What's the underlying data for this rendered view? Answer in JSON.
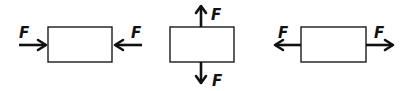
{
  "diagram": {
    "colors": {
      "stroke": "#111111",
      "background": "#ffffff"
    },
    "panels": [
      {
        "id": "compression",
        "box": {
          "x": 48,
          "y": 27,
          "w": 64,
          "h": 35
        },
        "forces": [
          {
            "label": "F",
            "direction": "right",
            "note": "pushes into left side"
          },
          {
            "label": "F",
            "direction": "left",
            "note": "pushes into right side"
          }
        ]
      },
      {
        "id": "vertical",
        "box": {
          "x": 170,
          "y": 27,
          "w": 64,
          "h": 35
        },
        "forces": [
          {
            "label": "F",
            "direction": "up",
            "note": "pulls from top"
          },
          {
            "label": "F",
            "direction": "down",
            "note": "pulls from bottom"
          }
        ]
      },
      {
        "id": "tension",
        "box": {
          "x": 301,
          "y": 27,
          "w": 65,
          "h": 35
        },
        "forces": [
          {
            "label": "F",
            "direction": "left",
            "note": "pulls from left side"
          },
          {
            "label": "F",
            "direction": "right",
            "note": "pulls from right side"
          }
        ]
      }
    ]
  }
}
